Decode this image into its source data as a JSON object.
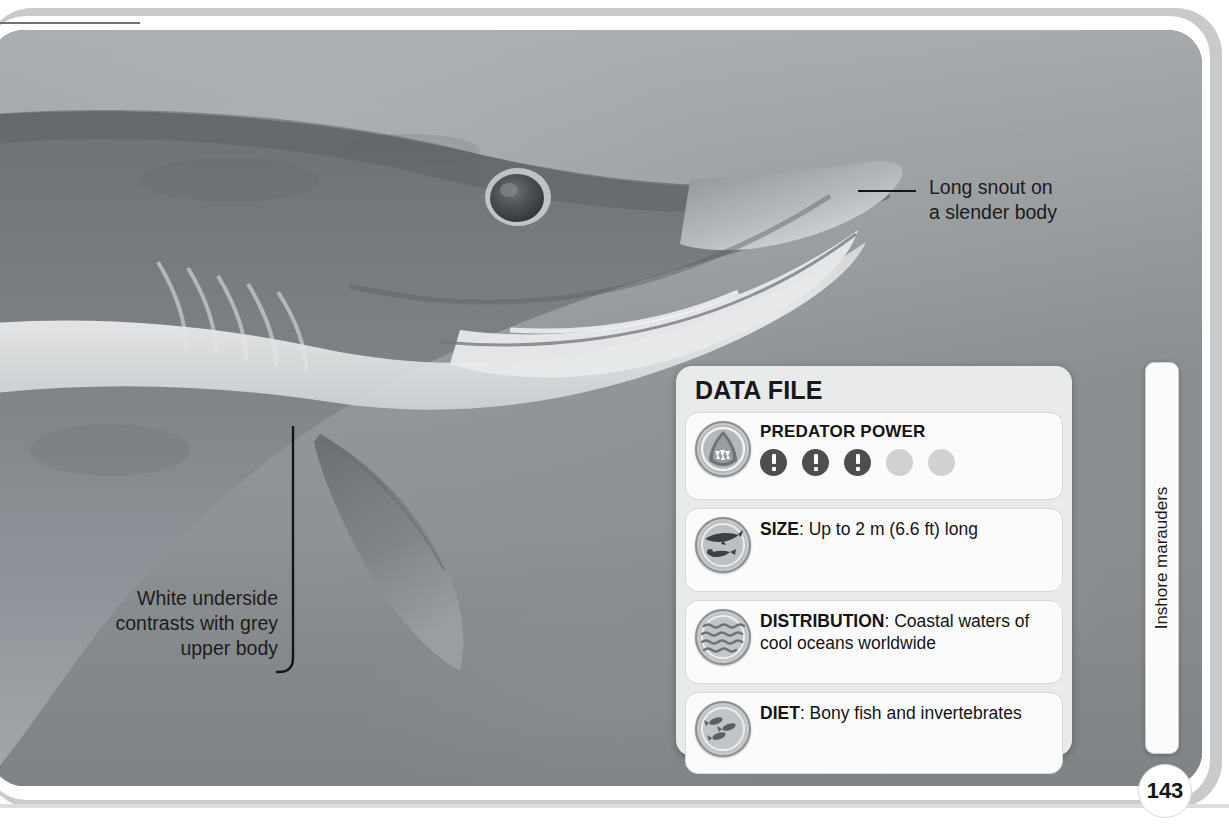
{
  "page": {
    "number": "143",
    "side_tab_label": "Inshore marauders"
  },
  "annotations": [
    {
      "id": "snout",
      "text": "Long snout on\na slender body",
      "align": "left"
    },
    {
      "id": "underside",
      "text": "White underside\ncontrasts with grey\nupper body",
      "align": "right"
    }
  ],
  "data_file": {
    "title": "DATA FILE",
    "rows": [
      {
        "id": "predator-power",
        "icon": "shark-jaws-icon",
        "label": "PREDATOR POWER",
        "rating_filled": 3,
        "rating_total": 5
      },
      {
        "id": "size",
        "icon": "shark-diver-scale-icon",
        "label": "SIZE",
        "value": "Up to 2 m (6.6 ft) long"
      },
      {
        "id": "distribution",
        "icon": "ocean-waves-icon",
        "label": "DISTRIBUTION",
        "value": "Coastal waters of cool oceans worldwide"
      },
      {
        "id": "diet",
        "icon": "fish-shoal-icon",
        "label": "DIET",
        "value": "Bony fish and invertebrates"
      }
    ]
  },
  "photo": {
    "subject": "blue-shark-head-underwater",
    "description": "Grey shark with long pointed snout and white underside swimming in open water"
  },
  "colors": {
    "panel_bg": "#e9eaea",
    "row_bg": "#fbfbfb",
    "text": "#141516",
    "dot_on": "#4c4e50",
    "dot_off": "#cfd1d2",
    "frame": "#c9cacb"
  }
}
